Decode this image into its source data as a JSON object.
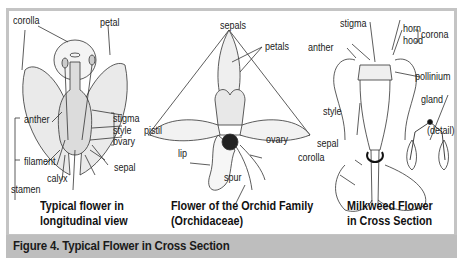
{
  "figure": {
    "caption": "Figure 4. Typical Flower in Cross Section",
    "colors": {
      "frame": "#c4c4c4",
      "caption_bar": "#bebebe",
      "panel": "#ffffff",
      "ink": "#222222"
    }
  },
  "panels": [
    {
      "title_line1": "Typical flower in",
      "title_line2": "longitudinal view",
      "labels": {
        "corolla": "corolla",
        "petal": "petal",
        "anther": "anther",
        "stigma": "stigma",
        "style": "style",
        "pistil": "pistil",
        "ovary": "ovary",
        "filament": "filament",
        "sepal": "sepal",
        "calyx": "calyx",
        "stamen": "stamen"
      }
    },
    {
      "title_line1": "Flower of the Orchid Family",
      "title_line2": "(Orchidaceae)",
      "labels": {
        "sepals": "sepals",
        "petals": "petals",
        "ovary": "ovary",
        "lip": "lip",
        "spur": "spur"
      }
    },
    {
      "title_line1": "Milkweed Flower",
      "title_line2": "in Cross Section",
      "labels": {
        "stigma": "stigma",
        "horn": "horn",
        "hood": "hood",
        "corona": "corona",
        "anther": "anther",
        "pollinium": "pollinium",
        "gland": "gland",
        "style": "style",
        "detail": "(detail)",
        "sepal": "sepal",
        "corolla": "corolla"
      }
    }
  ]
}
